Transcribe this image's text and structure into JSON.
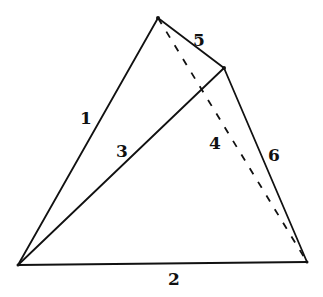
{
  "diagram": {
    "vertices": {
      "top": {
        "x": 158,
        "y": 18
      },
      "right": {
        "x": 224,
        "y": 68
      },
      "bottom_left": {
        "x": 18,
        "y": 265
      },
      "bottom_right": {
        "x": 307,
        "y": 262
      }
    },
    "edges": [
      {
        "id": "1",
        "label": "1",
        "from": "bottom_left",
        "to": "top",
        "style": "solid",
        "label_pos": {
          "x": 80,
          "y": 124
        }
      },
      {
        "id": "2",
        "label": "2",
        "from": "bottom_left",
        "to": "bottom_right",
        "style": "solid",
        "label_pos": {
          "x": 168,
          "y": 285
        }
      },
      {
        "id": "3",
        "label": "3",
        "from": "bottom_left",
        "to": "right",
        "style": "solid",
        "label_pos": {
          "x": 116,
          "y": 157
        }
      },
      {
        "id": "4",
        "label": "4",
        "from": "top",
        "to": "bottom_right",
        "style": "dashed",
        "label_pos": {
          "x": 209,
          "y": 149
        }
      },
      {
        "id": "5",
        "label": "5",
        "from": "top",
        "to": "right",
        "style": "solid",
        "label_pos": {
          "x": 193,
          "y": 46
        }
      },
      {
        "id": "6",
        "label": "6",
        "from": "right",
        "to": "bottom_right",
        "style": "solid",
        "label_pos": {
          "x": 268,
          "y": 161
        }
      }
    ]
  }
}
